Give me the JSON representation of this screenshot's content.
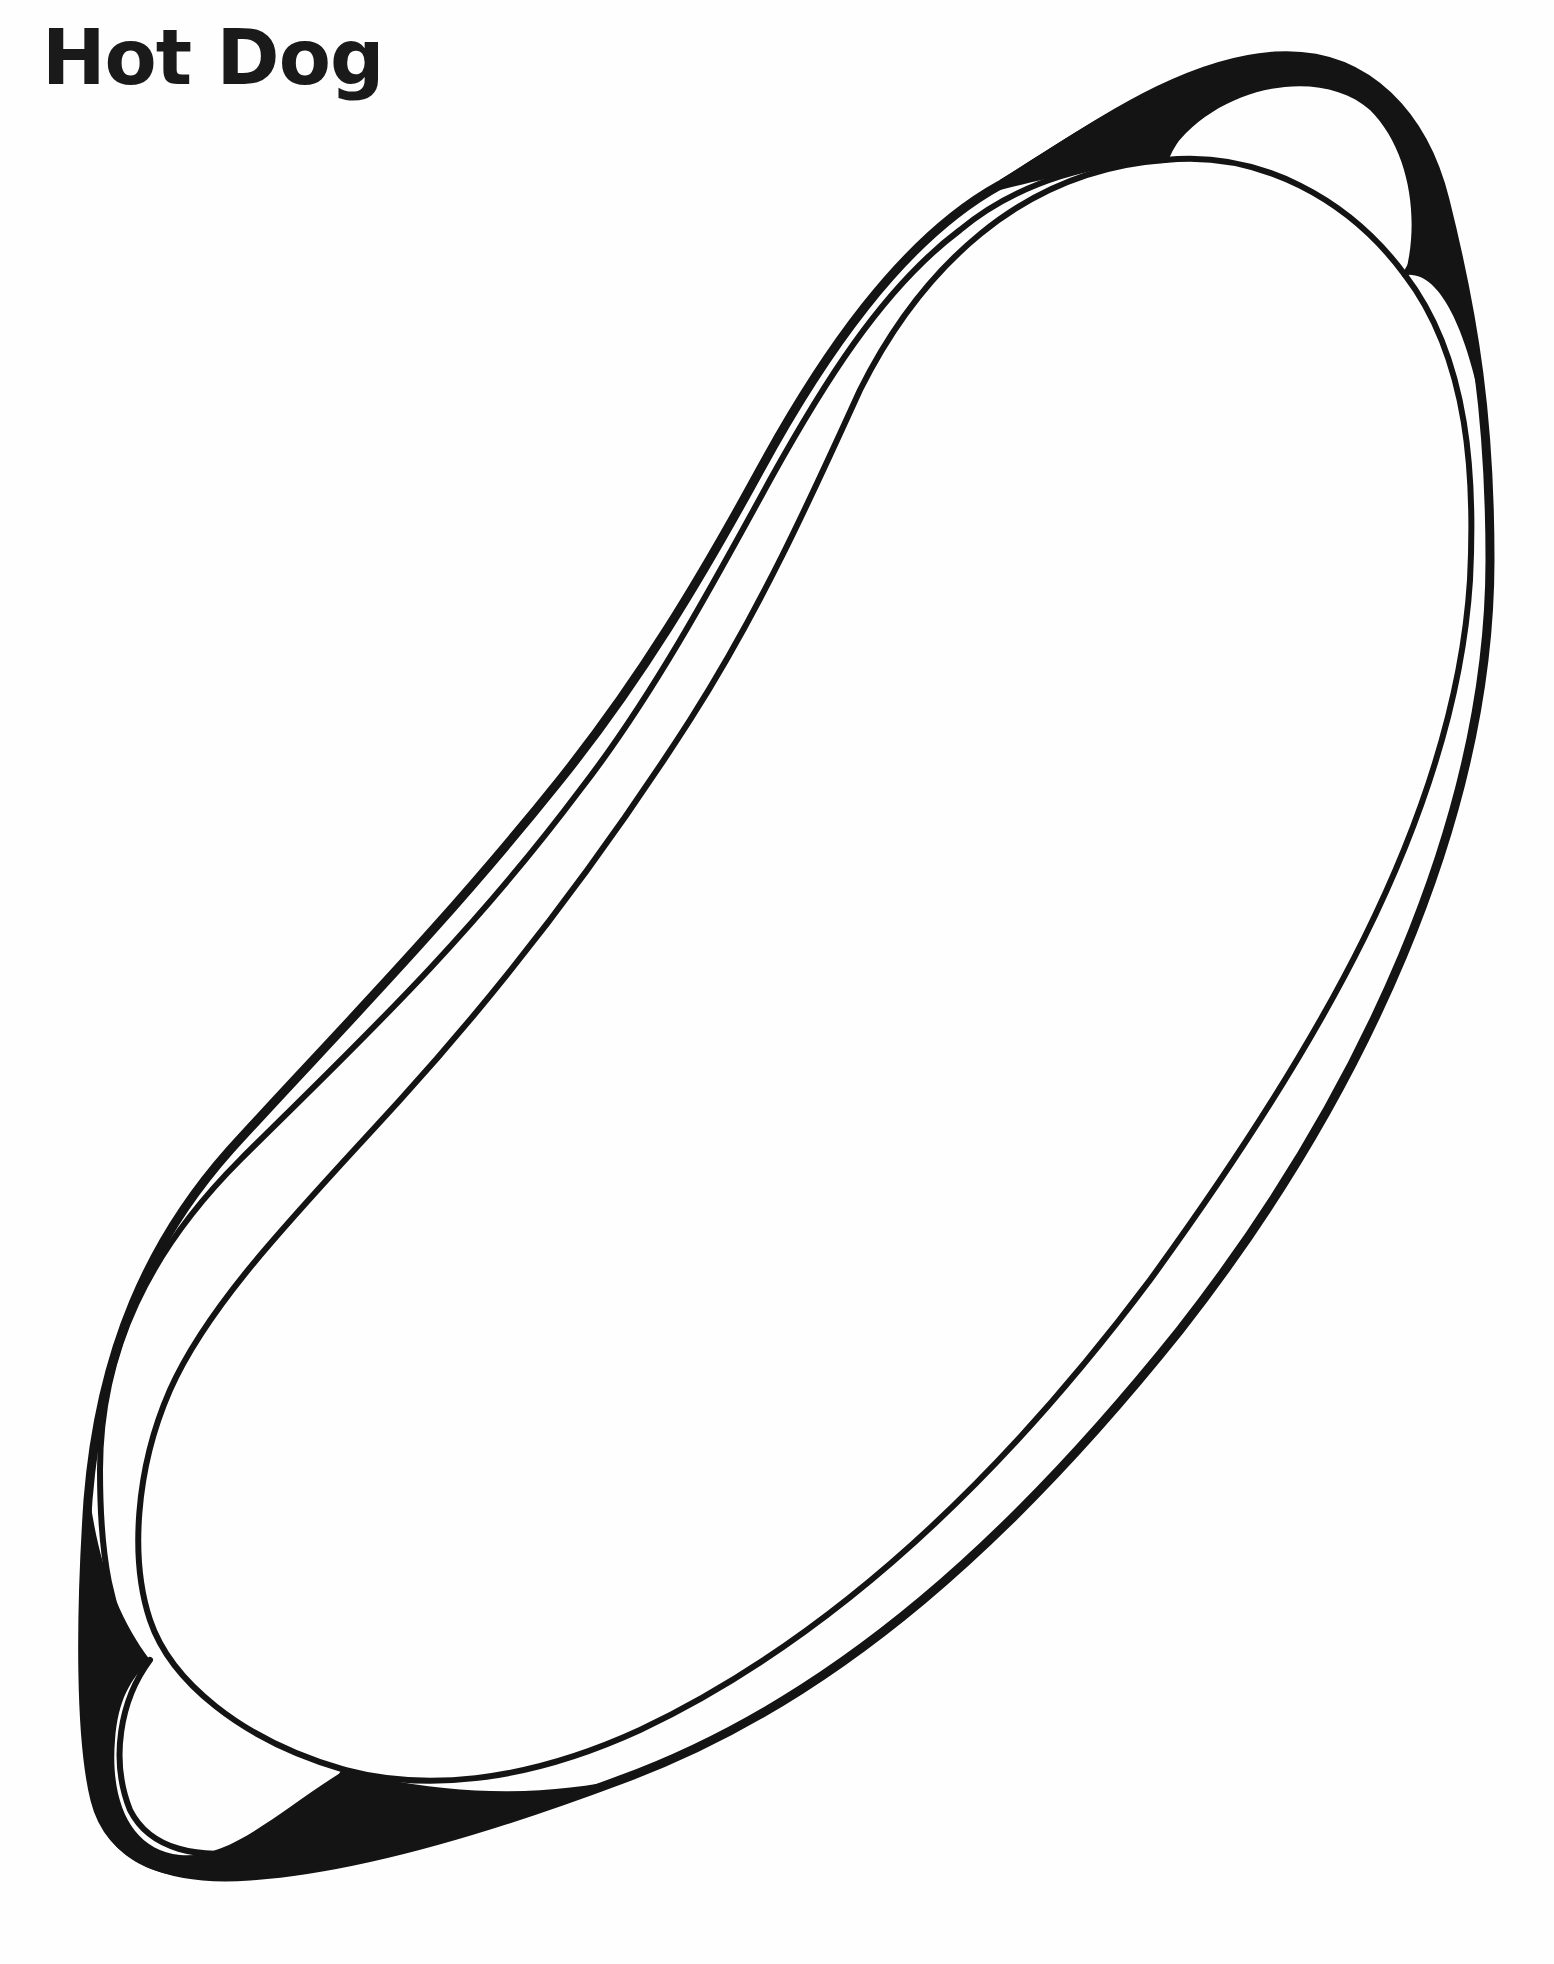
{
  "page": {
    "title": "Hot Dog",
    "kind": "coloring-page",
    "background_color": "#ffffff",
    "ink_color": "#141414"
  },
  "illustration": {
    "subject": "hot dog in bun",
    "parts": [
      {
        "name": "bun",
        "description": "outer bun outline with dark shaded crescents at both ends"
      },
      {
        "name": "sausage",
        "description": "inner elongated bean-shaped outline"
      },
      {
        "name": "bun-end-top",
        "description": "rounded bun end at top right"
      },
      {
        "name": "bun-end-bottom",
        "description": "rounded bun end at bottom left"
      }
    ]
  }
}
